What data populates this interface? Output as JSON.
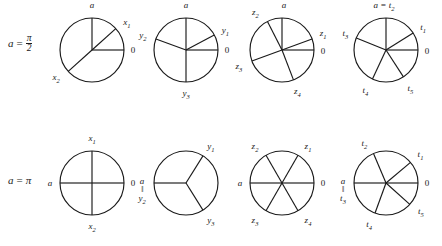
{
  "figure": {
    "width": 442,
    "height": 246,
    "stroke_color": "#1a1a1a",
    "background": "#ffffff",
    "rows": [
      {
        "id": "row-half-pi",
        "label_lhs": "a",
        "label_eq": "=",
        "label_num": "π",
        "label_den": "2",
        "label_text": "a = π/2",
        "label_x": 8,
        "label_y": 42,
        "circles": [
          {
            "id": "circle-1-x",
            "cx": 92,
            "cy": 50,
            "r": 32,
            "radii": [
              {
                "name": "radius-a",
                "angle": 90,
                "label": "a",
                "sub": "",
                "lx": 0,
                "ly": -12
              },
              {
                "name": "radius-x1",
                "angle": 42,
                "label": "x",
                "sub": "1",
                "lx": 11,
                "ly": -6
              },
              {
                "name": "radius-0",
                "angle": 0,
                "label": "0",
                "sub": "",
                "lx": 9,
                "ly": 1
              },
              {
                "name": "radius-x2",
                "angle": 222,
                "label": "x",
                "sub": "2",
                "lx": -12,
                "ly": 7
              }
            ]
          },
          {
            "id": "circle-2-y",
            "cx": 186,
            "cy": 50,
            "r": 32,
            "radii": [
              {
                "name": "radius-a",
                "angle": 90,
                "label": "a",
                "sub": "",
                "lx": 0,
                "ly": -12
              },
              {
                "name": "radius-y1",
                "angle": 28,
                "label": "y",
                "sub": "1",
                "lx": 11,
                "ly": -4
              },
              {
                "name": "radius-y2",
                "angle": 160,
                "label": "y",
                "sub": "2",
                "lx": -13,
                "ly": -3
              },
              {
                "name": "radius-0",
                "angle": 0,
                "label": "0",
                "sub": "",
                "lx": 9,
                "ly": 1
              },
              {
                "name": "radius-y3",
                "angle": 270,
                "label": "y",
                "sub": "3",
                "lx": 0,
                "ly": 12
              }
            ]
          },
          {
            "id": "circle-3-z",
            "cx": 282,
            "cy": 50,
            "r": 32,
            "radii": [
              {
                "name": "radius-a",
                "angle": 90,
                "label": "a",
                "sub": "",
                "lx": 2,
                "ly": -12
              },
              {
                "name": "radius-z2",
                "angle": 117,
                "label": "z",
                "sub": "2",
                "lx": -12,
                "ly": -8
              },
              {
                "name": "radius-z1",
                "angle": 20,
                "label": "z",
                "sub": "1",
                "lx": 11,
                "ly": -5
              },
              {
                "name": "radius-0",
                "angle": 0,
                "label": "0",
                "sub": "",
                "lx": 9,
                "ly": 2
              },
              {
                "name": "radius-z3",
                "angle": 200,
                "label": "z",
                "sub": "3",
                "lx": -13,
                "ly": 6
              },
              {
                "name": "radius-z4",
                "angle": 291,
                "label": "z",
                "sub": "4",
                "lx": 4,
                "ly": 12
              }
            ]
          },
          {
            "id": "circle-4-t",
            "cx": 386,
            "cy": 50,
            "r": 32,
            "radii": [
              {
                "name": "radius-a-t2",
                "angle": 90,
                "label": "a = t",
                "sub": "2",
                "lx": -2,
                "ly": -12
              },
              {
                "name": "radius-t1",
                "angle": 32,
                "label": "t",
                "sub": "1",
                "lx": 10,
                "ly": -5
              },
              {
                "name": "radius-0",
                "angle": 0,
                "label": "0",
                "sub": "",
                "lx": 9,
                "ly": 2
              },
              {
                "name": "radius-t3",
                "angle": 158,
                "label": "t",
                "sub": "3",
                "lx": -11,
                "ly": -4
              },
              {
                "name": "radius-t4",
                "angle": 245,
                "label": "t",
                "sub": "4",
                "lx": -7,
                "ly": 12
              },
              {
                "name": "radius-t5",
                "angle": 303,
                "label": "t",
                "sub": "5",
                "lx": 7,
                "ly": 12
              }
            ]
          }
        ]
      },
      {
        "id": "row-pi",
        "label_lhs": "a",
        "label_eq": "=",
        "label_pi": "π",
        "label_text": "a = π",
        "label_x": 8,
        "label_y": 183,
        "circles": [
          {
            "id": "circle-5-x",
            "cx": 92,
            "cy": 183,
            "r": 32,
            "radii": [
              {
                "name": "radius-x1",
                "angle": 90,
                "label": "x",
                "sub": "1",
                "lx": 0,
                "ly": -12
              },
              {
                "name": "radius-a",
                "angle": 180,
                "label": "a",
                "sub": "",
                "lx": -10,
                "ly": 1
              },
              {
                "name": "radius-0",
                "angle": 0,
                "label": "0",
                "sub": "",
                "lx": 9,
                "ly": 1
              },
              {
                "name": "radius-x2",
                "angle": 270,
                "label": "x",
                "sub": "2",
                "lx": 0,
                "ly": 12
              }
            ]
          },
          {
            "id": "circle-6-y",
            "cx": 186,
            "cy": 183,
            "r": 32,
            "stacked": {
              "name": "label-a-eq-y2",
              "top": "a",
              "mid": "‖",
              "bot": "y",
              "sub": "2",
              "angle": 180,
              "lx": -12,
              "ly": 0
            },
            "radii": [
              {
                "name": "radius-a-y2",
                "angle": 180,
                "label": "",
                "sub": "",
                "lx": 0,
                "ly": 0
              },
              {
                "name": "radius-y1",
                "angle": 58,
                "label": "y",
                "sub": "1",
                "lx": 8,
                "ly": -9
              },
              {
                "name": "radius-y3",
                "angle": 302,
                "label": "y",
                "sub": "3",
                "lx": 8,
                "ly": 11
              }
            ]
          },
          {
            "id": "circle-7-z",
            "cx": 282,
            "cy": 183,
            "r": 32,
            "radii": [
              {
                "name": "radius-z2",
                "angle": 120,
                "label": "z",
                "sub": "2",
                "lx": -11,
                "ly": -8
              },
              {
                "name": "radius-z1",
                "angle": 60,
                "label": "z",
                "sub": "1",
                "lx": 10,
                "ly": -8
              },
              {
                "name": "radius-a",
                "angle": 180,
                "label": "a",
                "sub": "",
                "lx": -10,
                "ly": 1
              },
              {
                "name": "radius-0",
                "angle": 0,
                "label": "0",
                "sub": "",
                "lx": 9,
                "ly": 1
              },
              {
                "name": "radius-z3",
                "angle": 240,
                "label": "z",
                "sub": "3",
                "lx": -11,
                "ly": 10
              },
              {
                "name": "radius-z4",
                "angle": 300,
                "label": "z",
                "sub": "4",
                "lx": 10,
                "ly": 10
              }
            ]
          },
          {
            "id": "circle-8-t",
            "cx": 386,
            "cy": 183,
            "r": 32,
            "stacked": {
              "name": "label-a-eq-t3",
              "top": "a",
              "mid": "‖",
              "bot": "t",
              "sub": "3",
              "angle": 180,
              "lx": -11,
              "ly": 0
            },
            "radii": [
              {
                "name": "radius-a-t3",
                "angle": 180,
                "label": "",
                "sub": "",
                "lx": 0,
                "ly": 0
              },
              {
                "name": "radius-t2",
                "angle": 113,
                "label": "t",
                "sub": "2",
                "lx": -9,
                "ly": -10
              },
              {
                "name": "radius-t1",
                "angle": 40,
                "label": "t",
                "sub": "1",
                "lx": 10,
                "ly": -7
              },
              {
                "name": "radius-0",
                "angle": 0,
                "label": "0",
                "sub": "",
                "lx": 9,
                "ly": 1
              },
              {
                "name": "radius-t4",
                "angle": 250,
                "label": "t",
                "sub": "4",
                "lx": -6,
                "ly": 12
              },
              {
                "name": "radius-t5",
                "angle": 318,
                "label": "t",
                "sub": "5",
                "lx": 11,
                "ly": 8
              }
            ]
          }
        ]
      }
    ]
  }
}
